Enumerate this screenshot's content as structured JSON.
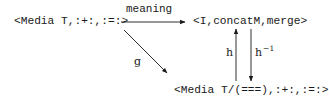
{
  "diagram": {
    "type": "commutative-diagram",
    "nodes": {
      "source": {
        "text": "<Media T,:+:,:=:>"
      },
      "target": {
        "text": "<I,concatM,merge>"
      },
      "quotient": {
        "text": "<Media T/(===),:+:,:=:>"
      }
    },
    "edges": {
      "meaning": {
        "label": "meaning",
        "from": "source",
        "to": "target"
      },
      "g": {
        "label": "g",
        "from": "source",
        "to": "quotient"
      },
      "h": {
        "label": "h",
        "from": "quotient",
        "to": "target"
      },
      "h_inverse": {
        "label": "h",
        "superscript": "−1",
        "from": "target",
        "to": "quotient"
      }
    },
    "colors": {
      "ink": "#1a1a1a",
      "background": "#ffffff"
    }
  }
}
